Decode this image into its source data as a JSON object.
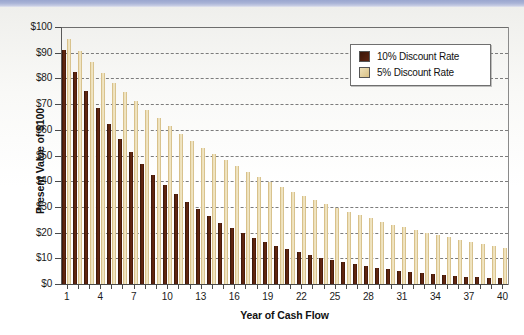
{
  "chart_data": {
    "type": "bar",
    "title": "",
    "xlabel": "Year of Cash Flow",
    "ylabel": "Present Value of $100",
    "xlim": [
      1,
      40
    ],
    "ylim": [
      0,
      100
    ],
    "grid": true,
    "legend_position": "top-right",
    "y_tick_labels": [
      "$100",
      "$90",
      "$80",
      "$70",
      "$60",
      "$50",
      "$40",
      "$30",
      "$20",
      "$10",
      "$0"
    ],
    "y_tick_values": [
      100,
      90,
      80,
      70,
      60,
      50,
      40,
      30,
      20,
      10,
      0
    ],
    "x_tick_labels": [
      "1",
      "4",
      "7",
      "10",
      "13",
      "16",
      "19",
      "22",
      "25",
      "28",
      "31",
      "34",
      "37",
      "40"
    ],
    "x_tick_values": [
      1,
      4,
      7,
      10,
      13,
      16,
      19,
      22,
      25,
      28,
      31,
      34,
      37,
      40
    ],
    "categories": [
      1,
      2,
      3,
      4,
      5,
      6,
      7,
      8,
      9,
      10,
      11,
      12,
      13,
      14,
      15,
      16,
      17,
      18,
      19,
      20,
      21,
      22,
      23,
      24,
      25,
      26,
      27,
      28,
      29,
      30,
      31,
      32,
      33,
      34,
      35,
      36,
      37,
      38,
      39,
      40
    ],
    "series": [
      {
        "name": "10% Discount Rate",
        "color": "#4a1d0c",
        "values": [
          90.9,
          82.6,
          75.1,
          68.3,
          62.1,
          56.4,
          51.3,
          46.7,
          42.4,
          38.6,
          35.0,
          31.9,
          29.0,
          26.3,
          23.9,
          21.8,
          19.8,
          18.0,
          16.4,
          14.9,
          13.5,
          12.3,
          11.2,
          10.2,
          9.2,
          8.4,
          7.6,
          6.9,
          6.3,
          5.7,
          5.2,
          4.7,
          4.3,
          3.9,
          3.6,
          3.2,
          2.9,
          2.7,
          2.4,
          2.2
        ]
      },
      {
        "name": "5% Discount Rate",
        "color": "#e0cb93",
        "values": [
          95.2,
          90.7,
          86.4,
          82.3,
          78.4,
          74.6,
          71.1,
          67.7,
          64.5,
          61.4,
          58.5,
          55.7,
          53.0,
          50.5,
          48.1,
          45.8,
          43.6,
          41.6,
          39.6,
          37.7,
          35.9,
          34.2,
          32.6,
          31.0,
          29.5,
          28.1,
          26.8,
          25.5,
          24.3,
          23.1,
          22.0,
          21.0,
          20.0,
          19.0,
          18.1,
          17.3,
          16.4,
          15.7,
          14.9,
          14.2
        ]
      }
    ]
  },
  "legend": {
    "items": [
      {
        "label": "10% Discount Rate",
        "swatch": "dark-brown"
      },
      {
        "label": "5% Discount Rate",
        "swatch": "tan"
      }
    ]
  }
}
